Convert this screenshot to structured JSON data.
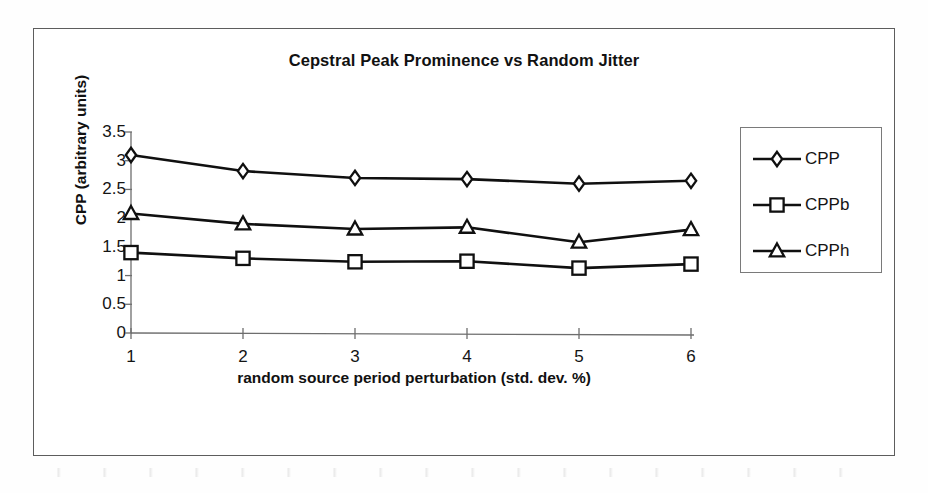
{
  "chart_data": {
    "type": "line",
    "title": "Cepstral Peak Prominence vs Random Jitter",
    "xlabel": "random source period perturbation (std. dev. %)",
    "ylabel": "CPP (arbitrary units)",
    "x": [
      1,
      2,
      3,
      4,
      5,
      6
    ],
    "categories": [
      "1",
      "2",
      "3",
      "4",
      "5",
      "6"
    ],
    "xticklabels": [
      "1",
      "2",
      "3",
      "4",
      "5",
      "6"
    ],
    "yticklabels": [
      "3.5",
      "3",
      "2.5",
      "2",
      "1.5",
      "1",
      "0.5",
      "0"
    ],
    "yticks": [
      3.5,
      3,
      2.5,
      2,
      1.5,
      1,
      0.5,
      0
    ],
    "ylim": [
      0,
      3.5
    ],
    "xlim": [
      1,
      6
    ],
    "grid": false,
    "legend_position": "right",
    "series": [
      {
        "name": "CPP",
        "marker": "diamond",
        "color": "#101010",
        "values": [
          3.1,
          2.82,
          2.7,
          2.68,
          2.6,
          2.65
        ]
      },
      {
        "name": "CPPb",
        "marker": "square",
        "color": "#101010",
        "values": [
          1.4,
          1.3,
          1.24,
          1.25,
          1.13,
          1.2
        ]
      },
      {
        "name": "CPPh",
        "marker": "triangle",
        "color": "#101010",
        "values": [
          2.08,
          1.9,
          1.81,
          1.84,
          1.58,
          1.8
        ]
      }
    ]
  },
  "legend": {
    "entries": [
      {
        "label": "CPP"
      },
      {
        "label": "CPPb"
      },
      {
        "label": "CPPh"
      }
    ]
  },
  "colors": {
    "ink": "#101010",
    "frame": "#5d5d5d",
    "axis": "#6e6e6e",
    "background": "#ffffff"
  }
}
